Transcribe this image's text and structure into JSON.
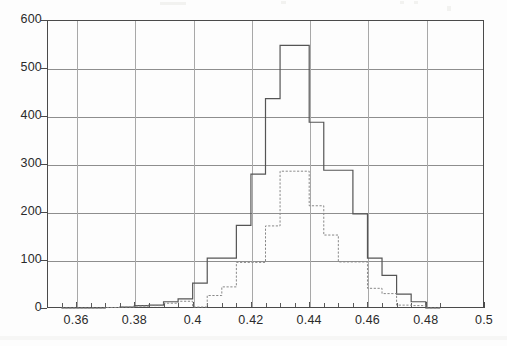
{
  "chart_data": {
    "type": "bar",
    "subtype": "histogram",
    "title": "",
    "subtitle": "",
    "xlabel": "",
    "ylabel": "",
    "xlim": [
      0.35,
      0.5
    ],
    "ylim": [
      0,
      600
    ],
    "grid": true,
    "legend_position": "none",
    "x_ticks": [
      "0.36",
      "0.38",
      "0.4",
      "0.42",
      "0.44",
      "0.46",
      "0.48",
      "0.5"
    ],
    "x_tick_values": [
      0.36,
      0.38,
      0.4,
      0.42,
      0.44,
      0.46,
      0.48,
      0.5
    ],
    "y_ticks": [
      "0",
      "100",
      "200",
      "300",
      "400",
      "500",
      "600"
    ],
    "y_tick_values": [
      0,
      100,
      200,
      300,
      400,
      500,
      600
    ],
    "bin_width": 0.005,
    "bin_edges": [
      0.355,
      0.36,
      0.365,
      0.37,
      0.375,
      0.38,
      0.385,
      0.39,
      0.395,
      0.4,
      0.405,
      0.41,
      0.415,
      0.42,
      0.425,
      0.43,
      0.435,
      0.44,
      0.445,
      0.45,
      0.455,
      0.46,
      0.465,
      0.47,
      0.475,
      0.48,
      0.485
    ],
    "series": [
      {
        "name": "solid-histogram",
        "style": "solid",
        "color": "#555555",
        "values": [
          0,
          0,
          0,
          1,
          2,
          5,
          6,
          13,
          19,
          52,
          104,
          104,
          172,
          279,
          436,
          547,
          547,
          387,
          287,
          287,
          196,
          104,
          68,
          29,
          13,
          0
        ]
      },
      {
        "name": "dotted-histogram",
        "style": "dotted",
        "color": "#888888",
        "values": [
          0,
          0,
          0,
          1,
          2,
          4,
          5,
          10,
          14,
          2,
          26,
          44,
          95,
          95,
          171,
          285,
          285,
          213,
          152,
          96,
          96,
          41,
          30,
          6,
          5,
          0
        ]
      }
    ]
  }
}
